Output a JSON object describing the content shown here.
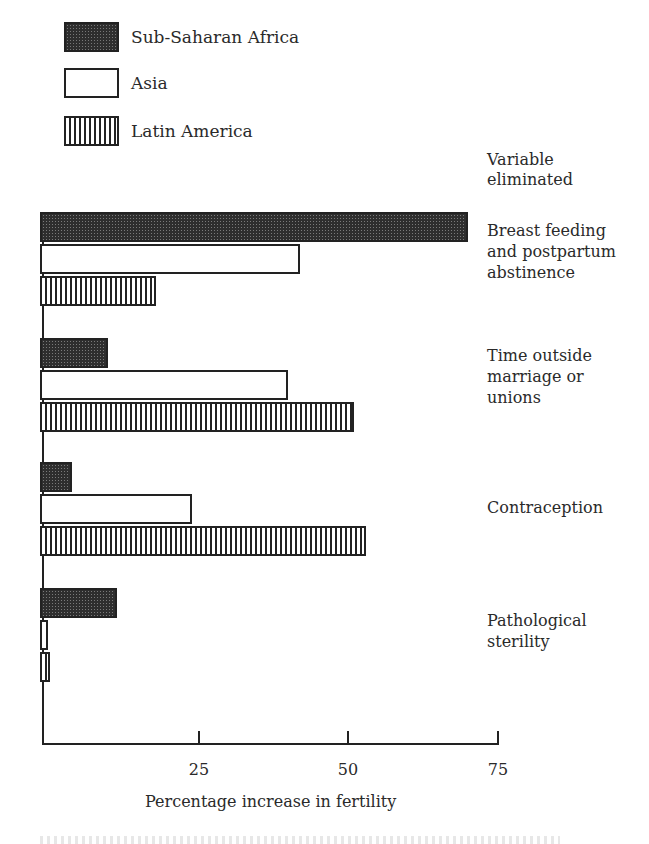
{
  "legend": [
    {
      "label": "Sub-Saharan Africa",
      "pattern": "dark-stipple"
    },
    {
      "label": "Asia",
      "pattern": "white"
    },
    {
      "label": "Latin America",
      "pattern": "vertical-hatch"
    }
  ],
  "variable_header": [
    "Variable",
    "eliminated"
  ],
  "categories": [
    {
      "lines": [
        "Breast feeding",
        "and postpartum",
        "abstinence"
      ]
    },
    {
      "lines": [
        "Time outside",
        "marriage or",
        "unions"
      ]
    },
    {
      "lines": [
        "Contraception"
      ]
    },
    {
      "lines": [
        "Pathological",
        "sterility"
      ]
    }
  ],
  "axis": {
    "ticks": [
      "25",
      "50",
      "75"
    ],
    "title": "Percentage increase in fertility"
  },
  "chart_data": {
    "type": "bar",
    "orientation": "horizontal",
    "title": "",
    "xlabel": "Percentage increase in fertility",
    "ylabel": "Variable eliminated",
    "categories": [
      "Breast feeding and postpartum abstinence",
      "Time outside marriage or unions",
      "Contraception",
      "Pathological sterility"
    ],
    "series": [
      {
        "name": "Sub-Saharan Africa",
        "values": [
          71,
          11,
          5,
          12.5
        ]
      },
      {
        "name": "Asia",
        "values": [
          43,
          41,
          25,
          1
        ]
      },
      {
        "name": "Latin America",
        "values": [
          19,
          52,
          54,
          1.3
        ]
      }
    ],
    "xlim": [
      0,
      75
    ],
    "xticks": [
      25,
      50,
      75
    ],
    "grid": false,
    "legend_position": "top-left"
  }
}
